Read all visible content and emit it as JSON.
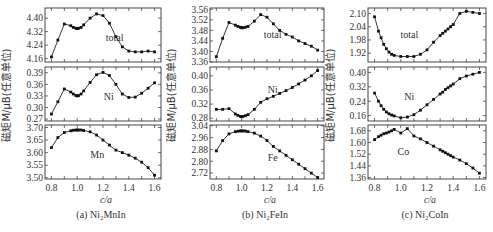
{
  "chart_data": [
    {
      "type": "line",
      "title": "(a) Ni2MnIn",
      "caption": "(a) Ni₂MnIn",
      "xlabel": "c/a",
      "ylabel": "磁矩M/μB(任意单位)",
      "xticks": [
        "0.8",
        "1.0",
        "1.2",
        "1.4",
        "1.6"
      ],
      "xlim": [
        0.75,
        1.65
      ],
      "panels": [
        {
          "name": "total",
          "ylim": [
            4.14,
            4.46
          ],
          "yticks": [
            "4.16",
            "4.24",
            "4.32",
            "4.40"
          ],
          "x": [
            0.8,
            0.85,
            0.9,
            0.95,
            0.97,
            0.99,
            1.0,
            1.01,
            1.03,
            1.05,
            1.1,
            1.15,
            1.2,
            1.25,
            1.3,
            1.35,
            1.4,
            1.45,
            1.5,
            1.55,
            1.6
          ],
          "y": [
            4.17,
            4.27,
            4.365,
            4.355,
            4.345,
            4.34,
            4.338,
            4.34,
            4.345,
            4.36,
            4.4,
            4.425,
            4.415,
            4.37,
            4.29,
            4.23,
            4.205,
            4.2,
            4.2,
            4.205,
            4.2
          ]
        },
        {
          "name": "Ni",
          "ylim": [
            0.265,
            0.405
          ],
          "yticks": [
            "0.27",
            "0.30",
            "0.33",
            "0.36",
            "0.39"
          ],
          "x": [
            0.8,
            0.85,
            0.9,
            0.95,
            0.97,
            0.99,
            1.0,
            1.01,
            1.03,
            1.05,
            1.1,
            1.15,
            1.2,
            1.25,
            1.3,
            1.35,
            1.4,
            1.45,
            1.5,
            1.55,
            1.6
          ],
          "y": [
            0.283,
            0.315,
            0.348,
            0.34,
            0.335,
            0.331,
            0.33,
            0.331,
            0.335,
            0.343,
            0.365,
            0.385,
            0.391,
            0.383,
            0.36,
            0.335,
            0.326,
            0.327,
            0.337,
            0.35,
            0.364
          ]
        },
        {
          "name": "Mn",
          "ylim": [
            3.495,
            3.71
          ],
          "yticks": [
            "3.50",
            "3.55",
            "3.60",
            "3.65",
            "3.70"
          ],
          "x": [
            0.8,
            0.85,
            0.9,
            0.95,
            0.97,
            0.99,
            1.0,
            1.01,
            1.03,
            1.05,
            1.1,
            1.15,
            1.2,
            1.25,
            1.3,
            1.35,
            1.4,
            1.45,
            1.5,
            1.55,
            1.6
          ],
          "y": [
            3.62,
            3.66,
            3.68,
            3.687,
            3.689,
            3.69,
            3.69,
            3.69,
            3.69,
            3.688,
            3.683,
            3.67,
            3.65,
            3.63,
            3.61,
            3.6,
            3.59,
            3.578,
            3.562,
            3.54,
            3.51
          ]
        }
      ]
    },
    {
      "type": "line",
      "title": "(b) Ni2FeIn",
      "caption": "(b) Ni₂FeIn",
      "xlabel": "c/a",
      "ylabel": "磁矩M/μB(任意单位)",
      "xticks": [
        "0.8",
        "1.0",
        "1.2",
        "1.4",
        "1.6"
      ],
      "xlim": [
        0.75,
        1.65
      ],
      "panels": [
        {
          "name": "total",
          "ylim": [
            3.36,
            3.565
          ],
          "yticks": [
            "3.36",
            "3.40",
            "3.44",
            "3.48",
            "3.52",
            "3.56"
          ],
          "x": [
            0.8,
            0.85,
            0.9,
            0.95,
            0.97,
            0.99,
            1.0,
            1.01,
            1.03,
            1.05,
            1.1,
            1.15,
            1.2,
            1.25,
            1.3,
            1.35,
            1.4,
            1.45,
            1.5,
            1.55,
            1.6
          ],
          "y": [
            3.38,
            3.45,
            3.51,
            3.5,
            3.495,
            3.492,
            3.49,
            3.49,
            3.492,
            3.495,
            3.515,
            3.54,
            3.53,
            3.505,
            3.48,
            3.465,
            3.455,
            3.44,
            3.43,
            3.42,
            3.405
          ]
        },
        {
          "name": "Ni",
          "ylim": [
            0.272,
            0.425
          ],
          "yticks": [
            "0.28",
            "0.32",
            "0.36",
            "0.40"
          ],
          "x": [
            0.8,
            0.85,
            0.9,
            0.95,
            0.97,
            0.99,
            1.0,
            1.01,
            1.03,
            1.05,
            1.1,
            1.15,
            1.2,
            1.25,
            1.3,
            1.35,
            1.4,
            1.45,
            1.5,
            1.55,
            1.6
          ],
          "y": [
            0.305,
            0.305,
            0.307,
            0.292,
            0.288,
            0.285,
            0.284,
            0.285,
            0.287,
            0.29,
            0.305,
            0.325,
            0.335,
            0.342,
            0.35,
            0.358,
            0.367,
            0.377,
            0.388,
            0.4,
            0.415
          ]
        },
        {
          "name": "Fe",
          "ylim": [
            2.68,
            3.045
          ],
          "yticks": [
            "2.72",
            "2.80",
            "2.88",
            "2.96",
            "3.04"
          ],
          "x": [
            0.8,
            0.85,
            0.9,
            0.95,
            0.97,
            0.99,
            1.0,
            1.01,
            1.03,
            1.05,
            1.1,
            1.15,
            1.2,
            1.25,
            1.3,
            1.35,
            1.4,
            1.45,
            1.5,
            1.55,
            1.6
          ],
          "y": [
            2.87,
            2.94,
            2.985,
            3.0,
            3.003,
            3.005,
            3.005,
            3.005,
            3.004,
            3.0,
            2.99,
            2.97,
            2.94,
            2.9,
            2.87,
            2.84,
            2.81,
            2.78,
            2.75,
            2.72,
            2.69
          ]
        }
      ]
    },
    {
      "type": "line",
      "title": "(c) Ni2CoIn",
      "caption": "(c) Ni₂CoIn",
      "xlabel": "c/a",
      "ylabel": "磁矩M/μB(任意单位)",
      "xticks": [
        "0.8",
        "1.0",
        "1.2",
        "1.4",
        "1.6"
      ],
      "xlim": [
        0.75,
        1.65
      ],
      "panels": [
        {
          "name": "total",
          "ylim": [
            1.88,
            2.125
          ],
          "yticks": [
            "1.92",
            "1.98",
            "2.04",
            "2.10"
          ],
          "x": [
            0.8,
            0.83,
            0.85,
            0.87,
            0.89,
            0.91,
            0.93,
            0.95,
            1.0,
            1.05,
            1.1,
            1.15,
            1.2,
            1.25,
            1.3,
            1.32,
            1.34,
            1.36,
            1.38,
            1.4,
            1.45,
            1.5,
            1.55,
            1.6
          ],
          "y": [
            2.085,
            2.02,
            1.99,
            1.96,
            1.94,
            1.925,
            1.915,
            1.91,
            1.905,
            1.905,
            1.905,
            1.915,
            1.935,
            1.97,
            2.0,
            2.01,
            2.02,
            2.03,
            2.04,
            2.05,
            2.1,
            2.11,
            2.105,
            2.1
          ]
        },
        {
          "name": "Ni",
          "ylim": [
            0.13,
            0.43
          ],
          "yticks": [
            "0.16",
            "0.24",
            "0.32",
            "0.40"
          ],
          "x": [
            0.8,
            0.83,
            0.85,
            0.87,
            0.89,
            0.91,
            0.93,
            0.95,
            1.0,
            1.05,
            1.1,
            1.15,
            1.2,
            1.25,
            1.3,
            1.32,
            1.34,
            1.36,
            1.38,
            1.4,
            1.45,
            1.5,
            1.55,
            1.6
          ],
          "y": [
            0.285,
            0.24,
            0.215,
            0.195,
            0.18,
            0.17,
            0.163,
            0.158,
            0.148,
            0.152,
            0.165,
            0.19,
            0.22,
            0.25,
            0.28,
            0.29,
            0.305,
            0.315,
            0.325,
            0.335,
            0.365,
            0.38,
            0.39,
            0.4
          ]
        },
        {
          "name": "Co",
          "ylim": [
            1.35,
            1.72
          ],
          "yticks": [
            "1.36",
            "1.44",
            "1.52",
            "1.60",
            "1.68"
          ],
          "x": [
            0.8,
            0.83,
            0.85,
            0.87,
            0.89,
            0.91,
            0.93,
            0.95,
            1.0,
            1.05,
            1.1,
            1.15,
            1.2,
            1.25,
            1.3,
            1.32,
            1.34,
            1.36,
            1.38,
            1.4,
            1.45,
            1.5,
            1.55,
            1.6
          ],
          "y": [
            1.62,
            1.64,
            1.65,
            1.66,
            1.665,
            1.672,
            1.68,
            1.69,
            1.665,
            1.695,
            1.645,
            1.625,
            1.6,
            1.575,
            1.55,
            1.54,
            1.53,
            1.52,
            1.51,
            1.5,
            1.48,
            1.455,
            1.425,
            1.39
          ]
        }
      ]
    }
  ]
}
